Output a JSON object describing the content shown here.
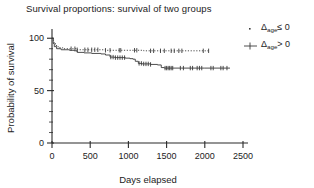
{
  "chart_data": {
    "type": "line",
    "title": "Survival proportions: survival of two groups",
    "xlabel": "Days elapsed",
    "ylabel": "Probability of survival",
    "xlim": [
      0,
      2500
    ],
    "ylim": [
      0,
      105
    ],
    "xticks": [
      0,
      500,
      1000,
      1500,
      2000,
      2500
    ],
    "yticks": [
      0,
      50,
      100
    ],
    "y_minor_step": 10,
    "grid": false,
    "legend_position": "right",
    "series": [
      {
        "name": "delta-age-le-0",
        "label_main": "Δ",
        "label_sub": "age",
        "label_tail": "≤ 0",
        "marker": "dotted-step",
        "color": "#3a3a3a",
        "steps": [
          [
            0,
            100
          ],
          [
            20,
            96
          ],
          [
            45,
            93
          ],
          [
            80,
            91
          ],
          [
            140,
            90
          ],
          [
            300,
            90
          ],
          [
            330,
            89
          ],
          [
            520,
            89
          ],
          [
            700,
            88.5
          ],
          [
            900,
            88.5
          ],
          [
            1200,
            88
          ],
          [
            1600,
            88
          ],
          [
            2050,
            88
          ]
        ],
        "censor_x": [
          250,
          300,
          330,
          430,
          470,
          520,
          560,
          600,
          700,
          760,
          880,
          900,
          1080,
          1110,
          1290,
          1330,
          1420,
          1470,
          1560,
          1600,
          1660,
          1700,
          1980,
          2050
        ]
      },
      {
        "name": "delta-age-gt-0",
        "label_main": "Δ",
        "label_sub": "age",
        "label_tail": "> 0",
        "marker": "step-with-censor-ticks",
        "color": "#3a3a3a",
        "steps": [
          [
            0,
            100
          ],
          [
            15,
            95
          ],
          [
            30,
            92
          ],
          [
            60,
            90
          ],
          [
            120,
            89
          ],
          [
            230,
            88.5
          ],
          [
            290,
            88
          ],
          [
            330,
            86.5
          ],
          [
            420,
            86
          ],
          [
            520,
            85.5
          ],
          [
            640,
            85
          ],
          [
            700,
            84
          ],
          [
            760,
            82
          ],
          [
            820,
            81.5
          ],
          [
            960,
            81
          ],
          [
            1020,
            80.5
          ],
          [
            1060,
            80
          ],
          [
            1090,
            78
          ],
          [
            1130,
            76
          ],
          [
            1180,
            75.5
          ],
          [
            1290,
            75
          ],
          [
            1380,
            74.5
          ],
          [
            1430,
            72
          ],
          [
            1470,
            71.5
          ],
          [
            1700,
            71.5
          ],
          [
            2000,
            71.5
          ],
          [
            2330,
            71.5
          ]
        ],
        "censor_x": [
          770,
          800,
          830,
          860,
          890,
          920,
          950,
          1140,
          1170,
          1200,
          1230,
          1260,
          1290,
          1480,
          1500,
          1520,
          1540,
          1560,
          1580,
          1680,
          1720,
          1810,
          1840,
          1900,
          1930,
          1960,
          2080,
          2110,
          2210,
          2240,
          2290
        ]
      }
    ]
  },
  "legend": {
    "entries": [
      {
        "marker": "dot-marker",
        "main": "Δ",
        "sub": "age",
        "tail": "≤ 0"
      },
      {
        "marker": "line-tick-marker",
        "main": "Δ",
        "sub": "age",
        "tail": "> 0"
      }
    ]
  },
  "axis": {
    "x_tick_labels": [
      "0",
      "500",
      "1000",
      "1500",
      "2000",
      "2500"
    ],
    "y_tick_labels": [
      "0",
      "50",
      "100"
    ],
    "x_title": "Days elapsed",
    "y_title": "Probability of survival"
  }
}
